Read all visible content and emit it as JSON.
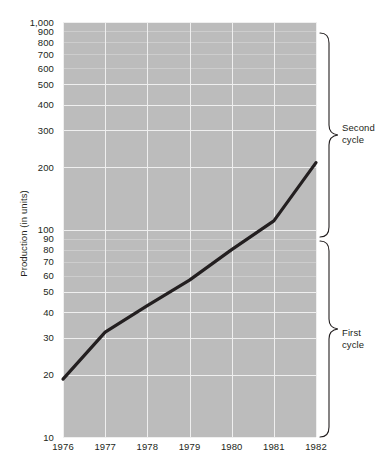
{
  "chart_data": {
    "type": "line",
    "title": "",
    "subtitle": "",
    "xlabel": "",
    "ylabel": "Production (in units)",
    "x": [
      1976,
      1977,
      1978,
      1979,
      1980,
      1981,
      1982
    ],
    "xtick_labels": [
      "1976",
      "1977",
      "1978",
      "1979",
      "1980",
      "1981",
      "1982"
    ],
    "xlim": [
      1976,
      1982
    ],
    "yscale": "log",
    "ylim": [
      10,
      1000
    ],
    "ytick_labels": [
      "1,000",
      "900",
      "800",
      "700",
      "600",
      "500",
      "400",
      "300",
      "200",
      "100",
      "90",
      "80",
      "70",
      "60",
      "50",
      "40",
      "30",
      "20",
      "10"
    ],
    "ytick_values": [
      1000,
      900,
      800,
      700,
      600,
      500,
      400,
      300,
      200,
      100,
      90,
      80,
      70,
      60,
      50,
      40,
      30,
      20,
      10
    ],
    "grid": true,
    "legend": "none",
    "series": [
      {
        "name": "Production",
        "values": [
          19,
          32,
          43,
          57,
          80,
          110,
          210
        ]
      }
    ],
    "annotations": [
      {
        "label_line1": "Second",
        "label_line2": "cycle",
        "range": [
          100,
          1000
        ]
      },
      {
        "label_line1": "First",
        "label_line2": "cycle",
        "range": [
          10,
          100
        ]
      }
    ],
    "colors": {
      "plot_background": "#bcbcbc",
      "gridline": "#efefef",
      "minor_gridline": "#cdcdcd",
      "series_line": "#231f20",
      "text": "#231f20",
      "page_background": "#ffffff"
    }
  },
  "axis": {
    "y_title": "Production (in units)",
    "y_ticks": [
      {
        "label": "1,000",
        "value": 1000
      },
      {
        "label": "900",
        "value": 900
      },
      {
        "label": "800",
        "value": 800
      },
      {
        "label": "700",
        "value": 700
      },
      {
        "label": "600",
        "value": 600
      },
      {
        "label": "500",
        "value": 500
      },
      {
        "label": "400",
        "value": 400
      },
      {
        "label": "300",
        "value": 300
      },
      {
        "label": "200",
        "value": 200
      },
      {
        "label": "100",
        "value": 100
      },
      {
        "label": "90",
        "value": 90
      },
      {
        "label": "80",
        "value": 80
      },
      {
        "label": "70",
        "value": 70
      },
      {
        "label": "60",
        "value": 60
      },
      {
        "label": "50",
        "value": 50
      },
      {
        "label": "40",
        "value": 40
      },
      {
        "label": "30",
        "value": 30
      },
      {
        "label": "20",
        "value": 20
      },
      {
        "label": "10",
        "value": 10
      }
    ],
    "x_ticks": [
      {
        "label": "1976",
        "value": 1976
      },
      {
        "label": "1977",
        "value": 1977
      },
      {
        "label": "1978",
        "value": 1978
      },
      {
        "label": "1979",
        "value": 1979
      },
      {
        "label": "1980",
        "value": 1980
      },
      {
        "label": "1981",
        "value": 1981
      },
      {
        "label": "1982",
        "value": 1982
      }
    ]
  },
  "braces": {
    "second": {
      "line1": "Second",
      "line2": "cycle"
    },
    "first": {
      "line1": "First",
      "line2": "cycle"
    }
  }
}
